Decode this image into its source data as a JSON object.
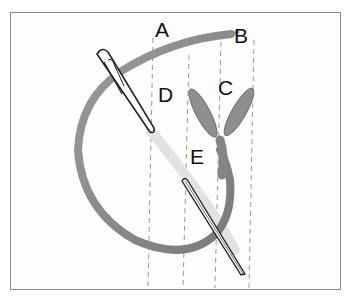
{
  "diagram": {
    "labels": [
      {
        "id": "A",
        "text": "A"
      },
      {
        "id": "B",
        "text": "B"
      },
      {
        "id": "C",
        "text": "C"
      },
      {
        "id": "D",
        "text": "D"
      },
      {
        "id": "E",
        "text": "E"
      }
    ],
    "colors": {
      "thread": "#8f8f8f",
      "thread_dark": "#6f6f6f",
      "guide_lines": "#9a9a9a",
      "frame_border": "#8a8a8a",
      "needle_outline": "#222222",
      "label_text": "#111111"
    }
  }
}
